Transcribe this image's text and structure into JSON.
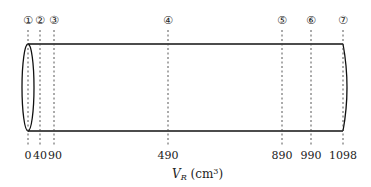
{
  "diagram": {
    "axis_label": "V",
    "axis_label_sub": "R",
    "axis_label_unit": " (cm",
    "axis_label_sup": "3",
    "axis_label_close": ")",
    "markers": [
      {
        "id": "①",
        "value": "0",
        "x": 28
      },
      {
        "id": "②",
        "value": "40",
        "x": 40
      },
      {
        "id": "③",
        "value": "90",
        "x": 54
      },
      {
        "id": "④",
        "value": "490",
        "x": 168
      },
      {
        "id": "⑤",
        "value": "890",
        "x": 282
      },
      {
        "id": "⑥",
        "value": "990",
        "x": 311
      },
      {
        "id": "⑦",
        "value": "1098",
        "x": 343
      }
    ]
  }
}
